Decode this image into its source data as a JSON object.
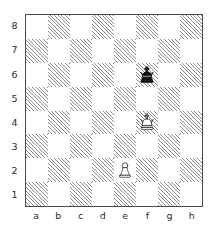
{
  "diagram": {
    "type": "chess-board-diagram",
    "orientation": "white-bottom",
    "board_size": 8,
    "colors": {
      "light_square": "#ffffff",
      "dark_square_hatch": "#8d8d8d",
      "border": "#4a4a4a",
      "label_text": "#2b2b2b",
      "white_piece_fill": "#ffffff",
      "white_piece_stroke": "#1a1a1a",
      "black_piece_fill": "#111111"
    },
    "file_labels": [
      "a",
      "b",
      "c",
      "d",
      "e",
      "f",
      "g",
      "h"
    ],
    "rank_labels": [
      "8",
      "7",
      "6",
      "5",
      "4",
      "3",
      "2",
      "1"
    ],
    "pieces": [
      {
        "square": "f6",
        "color": "black",
        "type": "king",
        "glyph": "black-king",
        "file_index": 5,
        "rank_index": 2
      },
      {
        "square": "f4",
        "color": "white",
        "type": "king",
        "glyph": "white-king",
        "file_index": 5,
        "rank_index": 4
      },
      {
        "square": "e2",
        "color": "white",
        "type": "pawn",
        "glyph": "white-pawn",
        "file_index": 4,
        "rank_index": 6
      }
    ],
    "position_fen": "8/8/5k2/8/5K2/8/4P3/8",
    "material": {
      "white": [
        "King e2-side on f4",
        "Pawn e2"
      ],
      "black": [
        "King f6"
      ]
    }
  }
}
